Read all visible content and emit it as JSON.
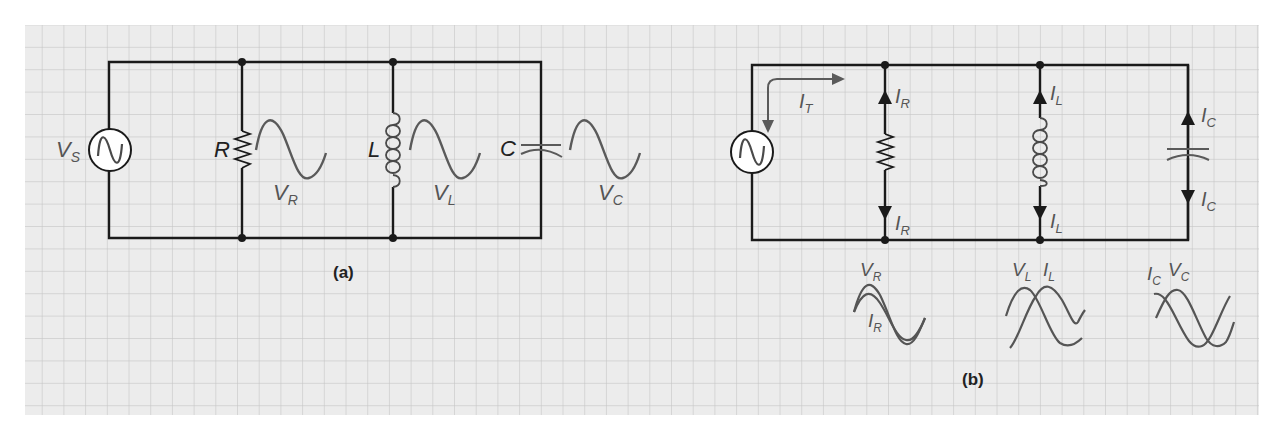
{
  "colors": {
    "grid_bg": "#ececec",
    "grid_line": "#c6c6c6",
    "wire": "#1a1a1a",
    "wave": "#5a5a5a",
    "component": "#4a4a4a"
  },
  "figure_a": {
    "caption": "(a)",
    "source_label": "V",
    "source_sub": "S",
    "resistor_label": "R",
    "inductor_label": "L",
    "capacitor_label": "C",
    "wave_r_label": "V",
    "wave_r_sub": "R",
    "wave_l_label": "V",
    "wave_l_sub": "L",
    "wave_c_label": "V",
    "wave_c_sub": "C"
  },
  "figure_b": {
    "caption": "(b)",
    "total_current_label": "I",
    "total_current_sub": "T",
    "ir_top": "I",
    "ir_top_sub": "R",
    "ir_bot": "I",
    "ir_bot_sub": "R",
    "il_top": "I",
    "il_top_sub": "L",
    "il_bot": "I",
    "il_bot_sub": "L",
    "ic_top": "I",
    "ic_top_sub": "C",
    "ic_bot": "I",
    "ic_bot_sub": "C",
    "phase_r": {
      "v": "V",
      "v_sub": "R",
      "i": "I",
      "i_sub": "R"
    },
    "phase_l": {
      "v": "V",
      "v_sub": "L",
      "i": "I",
      "i_sub": "L"
    },
    "phase_c": {
      "i": "I",
      "i_sub": "C",
      "v": "V",
      "v_sub": "C"
    }
  }
}
